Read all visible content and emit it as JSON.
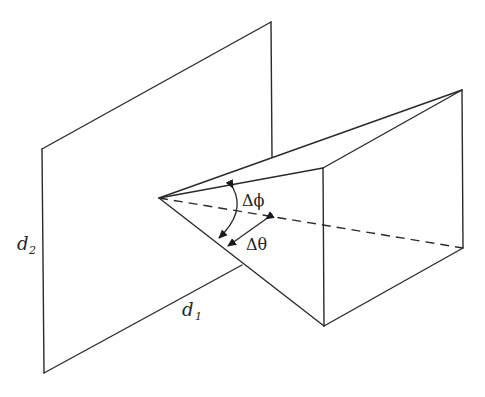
{
  "diagram": {
    "type": "geometry",
    "labels": {
      "d2": "d",
      "d2_sub": "2",
      "d1": "d",
      "d1_sub": "1",
      "delta_phi": "Δϕ",
      "delta_theta": "Δθ"
    },
    "colors": {
      "line": "#2a2a2a",
      "background": "#ffffff"
    },
    "plane": {
      "top_left": [
        42,
        149
      ],
      "top_right": [
        271,
        22
      ],
      "right_hidden_at": [
        272,
        157
      ],
      "bottom_left": [
        44,
        373
      ],
      "bottom_hidden_at": [
        242,
        265
      ]
    },
    "pyramid": {
      "apex": [
        159,
        198
      ],
      "top_right": [
        462,
        90
      ],
      "front_top": [
        323,
        168
      ],
      "bottom_front": [
        324,
        326
      ],
      "right_bottom": [
        463,
        248
      ]
    }
  }
}
